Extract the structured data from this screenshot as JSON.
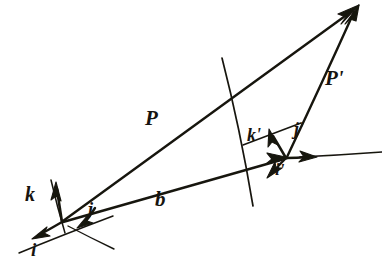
{
  "figure": {
    "kind": "hand-drawn-vector-diagram",
    "background_color": "#ffffff",
    "ink_color": "#17140f",
    "width": 382,
    "height": 273
  },
  "labels": {
    "P": "P",
    "P_prime": "P'",
    "b": "b",
    "k": "k",
    "i": "i",
    "j": "j",
    "k_prime": "k'",
    "j_prime": "j'",
    "i_prime": "i'"
  },
  "geometry": {
    "origin_unprimed": [
      62,
      222
    ],
    "origin_primed": [
      286,
      158
    ],
    "apex_point": [
      358,
      6
    ],
    "vectors": [
      {
        "name": "P",
        "from": [
          62,
          222
        ],
        "to": [
          358,
          6
        ],
        "arrow": true,
        "label": "P"
      },
      {
        "name": "b",
        "from": [
          62,
          222
        ],
        "to": [
          286,
          158
        ],
        "arrow": true,
        "label": "b"
      },
      {
        "name": "P'",
        "from": [
          286,
          158
        ],
        "to": [
          358,
          6
        ],
        "arrow": true,
        "label": "P'"
      },
      {
        "name": "k",
        "from": [
          62,
          222
        ],
        "to": [
          57,
          184
        ],
        "arrow": true,
        "label": "k"
      },
      {
        "name": "i",
        "from": [
          62,
          222
        ],
        "to": [
          33,
          238
        ],
        "arrow": true,
        "label": "i"
      },
      {
        "name": "j",
        "from": [
          95,
          209
        ],
        "to": [
          78,
          227
        ],
        "arrow": true,
        "label": "j"
      },
      {
        "name": "k'",
        "from": [
          286,
          158
        ],
        "to": [
          271,
          131
        ],
        "arrow": true,
        "label": "k'"
      },
      {
        "name": "j'",
        "from": [
          286,
          158
        ],
        "to": [
          316,
          157
        ],
        "arrow": true,
        "label": "j'"
      },
      {
        "name": "i'",
        "from": [
          286,
          158
        ],
        "to": [
          268,
          176
        ],
        "arrow": true,
        "label": "i'"
      }
    ],
    "construction_lines": [
      {
        "name": "axis-line-k-extension",
        "from": [
          51,
          180
        ],
        "to": [
          65,
          232
        ]
      },
      {
        "name": "axis-line-i-extension",
        "from": [
          20,
          252
        ],
        "to": [
          112,
          216
        ]
      },
      {
        "name": "axis-line-j-extension",
        "from": [
          68,
          226
        ],
        "to": [
          113,
          248
        ]
      },
      {
        "name": "axis-line-kprime",
        "from": [
          222,
          58
        ],
        "to": [
          252,
          205
        ]
      },
      {
        "name": "axis-line-iprime",
        "from": [
          243,
          144
        ],
        "to": [
          300,
          124
        ]
      },
      {
        "name": "axis-line-jprime",
        "from": [
          286,
          158
        ],
        "to": [
          382,
          152
        ]
      }
    ]
  },
  "label_positions": {
    "P": [
      145,
      118
    ],
    "P'": [
      325,
      78
    ],
    "b": [
      155,
      198
    ],
    "k": [
      25,
      192
    ],
    "i": [
      32,
      247
    ],
    "j": [
      89,
      208
    ],
    "k'": [
      249,
      134
    ],
    "j'": [
      296,
      128
    ],
    "i'": [
      276,
      167
    ]
  }
}
